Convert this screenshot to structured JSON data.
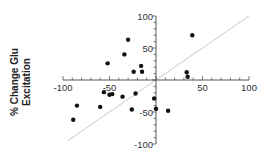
{
  "chart_data": {
    "type": "scatter",
    "title": "",
    "xlabel": "",
    "ylabel": "% Change Glu Excitation",
    "xlim": [
      -100,
      100
    ],
    "ylim": [
      -100,
      100
    ],
    "x_ticks": [
      -100,
      -50,
      50,
      100
    ],
    "y_ticks": [
      100,
      50,
      -50,
      -100
    ],
    "x_tick_labels": [
      "-100",
      "-50",
      "50",
      "100"
    ],
    "y_tick_labels": [
      "100",
      "50",
      "-50",
      "-100"
    ],
    "grid": false,
    "legend": null,
    "reference_line": {
      "type": "identity",
      "from": [
        -95,
        -95
      ],
      "to": [
        100,
        100
      ],
      "color": "#d8d8d8"
    },
    "point_color": "#111111",
    "points": [
      {
        "x": 39,
        "y": 70
      },
      {
        "x": 33,
        "y": 12
      },
      {
        "x": 34,
        "y": 5
      },
      {
        "x": -30,
        "y": 63
      },
      {
        "x": -34,
        "y": 40
      },
      {
        "x": -52,
        "y": 26
      },
      {
        "x": -16,
        "y": 22
      },
      {
        "x": -24,
        "y": 13
      },
      {
        "x": -15,
        "y": 13
      },
      {
        "x": -56,
        "y": -19
      },
      {
        "x": -50,
        "y": -23
      },
      {
        "x": -47,
        "y": -22
      },
      {
        "x": -36,
        "y": -26
      },
      {
        "x": -22,
        "y": -21
      },
      {
        "x": -2,
        "y": -29
      },
      {
        "x": -85,
        "y": -40
      },
      {
        "x": -60,
        "y": -42
      },
      {
        "x": -26,
        "y": -46
      },
      {
        "x": -89,
        "y": -62
      },
      {
        "x": 0,
        "y": -45
      },
      {
        "x": 13,
        "y": -48
      }
    ]
  }
}
